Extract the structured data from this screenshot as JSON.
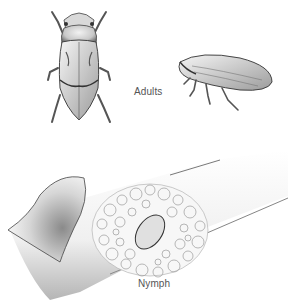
{
  "figure": {
    "labels": {
      "adults": "Adults",
      "nymph": "Nymph"
    },
    "subjects": [
      {
        "name": "adult-dorsal-view",
        "group": "adults"
      },
      {
        "name": "adult-side-view",
        "group": "adults"
      },
      {
        "name": "nymph-in-spittle-on-stem",
        "group": "nymph"
      }
    ],
    "colors": {
      "background": "#ffffff",
      "ink": "#333333",
      "label": "#555555",
      "shade": "#9a9a9a"
    }
  }
}
